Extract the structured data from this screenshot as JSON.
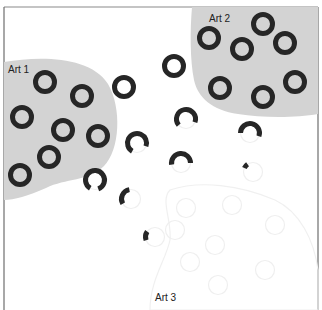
{
  "diagram": {
    "frame": {
      "stroke": "#6e6e6e"
    },
    "colors": {
      "region_fill": "#d3d3d3",
      "ring": "#262626",
      "ghost_ring": "#efefef",
      "ghost_region": "#eeeeee"
    },
    "regions": [
      {
        "id": "art1",
        "label": "Art 1",
        "label_x": 8,
        "label_y": 73
      },
      {
        "id": "art2",
        "label": "Art 2",
        "label_x": 209,
        "label_y": 22
      },
      {
        "id": "art3",
        "label": "Art 3",
        "label_x": 155,
        "label_y": 301
      }
    ],
    "rings": {
      "art1": [
        {
          "cx": 45,
          "cy": 82
        },
        {
          "cx": 82,
          "cy": 96
        },
        {
          "cx": 22,
          "cy": 117
        },
        {
          "cx": 63,
          "cy": 130
        },
        {
          "cx": 98,
          "cy": 136
        },
        {
          "cx": 49,
          "cy": 157
        },
        {
          "cx": 20,
          "cy": 175
        }
      ],
      "middle": [
        {
          "cx": 124,
          "cy": 87
        },
        {
          "cx": 174,
          "cy": 66
        }
      ],
      "art2": [
        {
          "cx": 209,
          "cy": 38
        },
        {
          "cx": 263,
          "cy": 24
        },
        {
          "cx": 242,
          "cy": 49
        },
        {
          "cx": 285,
          "cy": 43
        },
        {
          "cx": 220,
          "cy": 88
        },
        {
          "cx": 263,
          "cy": 97
        },
        {
          "cx": 295,
          "cy": 82
        }
      ],
      "broken": [
        {
          "cx": 95,
          "cy": 180,
          "start": 120,
          "end": 430
        },
        {
          "cx": 186,
          "cy": 119,
          "start": 140,
          "end": 380
        },
        {
          "cx": 137,
          "cy": 143,
          "start": 120,
          "end": 380
        },
        {
          "cx": 181,
          "cy": 163,
          "start": 170,
          "end": 360
        },
        {
          "cx": 131,
          "cy": 199,
          "start": 150,
          "end": 260
        },
        {
          "cx": 250,
          "cy": 133,
          "start": 180,
          "end": 380
        },
        {
          "cx": 155,
          "cy": 237,
          "start": 160,
          "end": 215
        },
        {
          "cx": 253,
          "cy": 172,
          "start": 205,
          "end": 235
        }
      ],
      "ghost": [
        {
          "cx": 186,
          "cy": 208
        },
        {
          "cx": 232,
          "cy": 205
        },
        {
          "cx": 275,
          "cy": 225
        },
        {
          "cx": 215,
          "cy": 245
        },
        {
          "cx": 190,
          "cy": 262
        },
        {
          "cx": 265,
          "cy": 270
        },
        {
          "cx": 218,
          "cy": 285
        },
        {
          "cx": 175,
          "cy": 230
        }
      ]
    }
  }
}
